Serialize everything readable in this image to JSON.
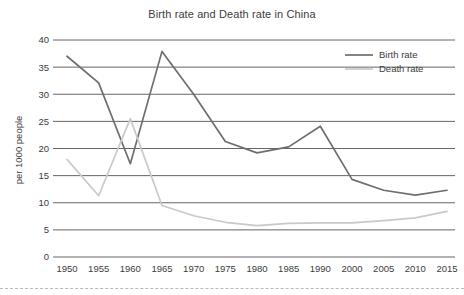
{
  "chart_data": {
    "type": "line",
    "title": "Birth rate and Death rate in China",
    "xlabel": "",
    "ylabel": "per 1000 people",
    "categories": [
      "1950",
      "1955",
      "1960",
      "1965",
      "1970",
      "1975",
      "1980",
      "1985",
      "1990",
      "2000",
      "2005",
      "2010",
      "2015"
    ],
    "ylim": [
      0,
      40
    ],
    "yticks": [
      0,
      5,
      10,
      15,
      20,
      25,
      30,
      35,
      40
    ],
    "ytick_labels": [
      "0",
      "5",
      "10",
      "15",
      "20",
      "25",
      "30",
      "35",
      "40"
    ],
    "grid": true,
    "legend_position": "top-right",
    "series": [
      {
        "name": "Birth rate",
        "color": "#6e6e6e",
        "values": [
          37.0,
          32.1,
          17.2,
          37.9,
          30.0,
          21.3,
          19.2,
          20.3,
          24.1,
          14.3,
          12.3,
          11.4,
          12.3
        ]
      },
      {
        "name": "Death rate",
        "color": "#c9c9c9",
        "values": [
          18.0,
          11.3,
          25.5,
          9.5,
          7.6,
          6.4,
          5.8,
          6.2,
          6.3,
          6.3,
          6.7,
          7.2,
          8.4
        ]
      }
    ]
  },
  "legend": {
    "items": [
      {
        "label": "Birth rate"
      },
      {
        "label": "Death rate"
      }
    ]
  },
  "colors": {
    "birth_rate": "#6e6e6e",
    "death_rate": "#c9c9c9",
    "grid": "#555555",
    "text": "#3c3c3c",
    "background": "#ffffff"
  }
}
